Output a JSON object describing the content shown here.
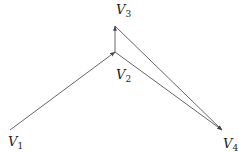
{
  "diagram": {
    "type": "directed-graph",
    "nodes": [
      {
        "id": "V1",
        "label": "V",
        "sub": "1",
        "x": 10,
        "y": 130
      },
      {
        "id": "V2",
        "label": "V",
        "sub": "2",
        "x": 115,
        "y": 52
      },
      {
        "id": "V3",
        "label": "V",
        "sub": "3",
        "x": 115,
        "y": 26
      },
      {
        "id": "V4",
        "label": "V",
        "sub": "4",
        "x": 222,
        "y": 130
      }
    ],
    "edges": [
      {
        "from": "V1",
        "to": "V2"
      },
      {
        "from": "V2",
        "to": "V3"
      },
      {
        "from": "V2",
        "to": "V4"
      },
      {
        "from": "V3",
        "to": "V4"
      }
    ],
    "colors": {
      "edge": "#555555",
      "text": "#222222",
      "background": "#ffffff"
    }
  }
}
